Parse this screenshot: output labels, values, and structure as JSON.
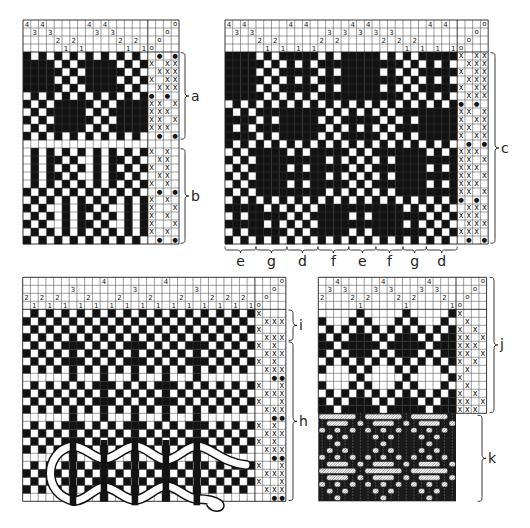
{
  "drafts": [
    {
      "threading": [
        4,
        3,
        4,
        3,
        2,
        1,
        2,
        1,
        4,
        3,
        4,
        3,
        2,
        1,
        2,
        1
      ],
      "tieup_marker": "o",
      "liftplan": [
        {
          "lift": [
            2,
            4
          ],
          "mark": "●"
        },
        {
          "lift": [
            1,
            3,
            4
          ],
          "mark": "x"
        },
        {
          "lift": [
            2,
            3,
            4
          ],
          "mark": "x"
        },
        {
          "lift": [
            1,
            3,
            4
          ],
          "mark": "x"
        },
        {
          "lift": [
            2,
            3,
            4
          ],
          "mark": "x"
        },
        {
          "lift": [
            1,
            3
          ],
          "mark": "●"
        },
        {
          "lift": [
            1,
            2,
            4
          ],
          "mark": "x"
        },
        {
          "lift": [
            1,
            2,
            3
          ],
          "mark": "x"
        },
        {
          "lift": [
            1,
            2,
            4
          ],
          "mark": "x"
        },
        {
          "lift": [
            1,
            2,
            3
          ],
          "mark": "x"
        },
        {
          "lift": [
            2,
            4
          ],
          "mark": "●"
        },
        {
          "lift": [],
          "mark": ""
        },
        {
          "lift": [
            1,
            3
          ],
          "mark": "x"
        },
        {
          "lift": [
            2,
            3
          ],
          "mark": "x"
        },
        {
          "lift": [
            1,
            3
          ],
          "mark": "x"
        },
        {
          "lift": [
            2,
            3
          ],
          "mark": "x"
        },
        {
          "lift": [
            1,
            3
          ],
          "mark": "x"
        },
        {
          "lift": [
            2,
            4
          ],
          "mark": "●"
        },
        {
          "lift": [
            1,
            3
          ],
          "mark": "x"
        },
        {
          "lift": [
            1,
            4
          ],
          "mark": "x"
        },
        {
          "lift": [
            1,
            3
          ],
          "mark": "x"
        },
        {
          "lift": [
            1,
            4
          ],
          "mark": "x"
        },
        {
          "lift": [
            1,
            3
          ],
          "mark": "x"
        },
        {
          "lift": [
            2,
            4
          ],
          "mark": "●"
        }
      ],
      "sections": [
        {
          "label": "a",
          "from_row": 0,
          "to_row": 10
        },
        {
          "label": "b",
          "from_row": 12,
          "to_row": 23
        }
      ]
    },
    {
      "threading": [
        4,
        3,
        4,
        3,
        2,
        1,
        2,
        1,
        4,
        1,
        4,
        1,
        2,
        3,
        2,
        3,
        4,
        3,
        4,
        3,
        2,
        3,
        2,
        1,
        2,
        1,
        4,
        1,
        4,
        1
      ],
      "tieup_marker": "o",
      "liftplan": [
        {
          "lift": [
            1,
            3,
            4
          ],
          "mark": "x"
        },
        {
          "lift": [
            2,
            3,
            4
          ],
          "mark": "x"
        },
        {
          "lift": [
            1,
            3,
            4
          ],
          "mark": "x"
        },
        {
          "lift": [
            2,
            3,
            4
          ],
          "mark": "x"
        },
        {
          "lift": [
            1,
            3,
            4
          ],
          "mark": "x"
        },
        {
          "lift": [
            2,
            3,
            4
          ],
          "mark": "x"
        },
        {
          "lift": [
            1,
            3
          ],
          "mark": "●"
        },
        {
          "lift": [
            1,
            2,
            4
          ],
          "mark": "x"
        },
        {
          "lift": [
            1,
            3,
            4
          ],
          "mark": "x"
        },
        {
          "lift": [
            1,
            2,
            4
          ],
          "mark": "x"
        },
        {
          "lift": [
            1,
            3,
            4
          ],
          "mark": "x"
        },
        {
          "lift": [
            2,
            4
          ],
          "mark": "●"
        },
        {
          "lift": [
            1,
            2,
            3
          ],
          "mark": "x"
        },
        {
          "lift": [
            1,
            2,
            4
          ],
          "mark": "x"
        },
        {
          "lift": [
            1,
            2,
            3
          ],
          "mark": "x"
        },
        {
          "lift": [
            1,
            2,
            4
          ],
          "mark": "x"
        },
        {
          "lift": [
            1,
            2,
            3
          ],
          "mark": "x"
        },
        {
          "lift": [
            1,
            2,
            4
          ],
          "mark": "x"
        },
        {
          "lift": [
            1,
            3
          ],
          "mark": "●"
        },
        {
          "lift": [
            2,
            3,
            4
          ],
          "mark": "x"
        },
        {
          "lift": [
            1,
            2,
            3
          ],
          "mark": "x"
        },
        {
          "lift": [
            2,
            3,
            4
          ],
          "mark": "x"
        },
        {
          "lift": [
            1,
            2,
            3
          ],
          "mark": "x"
        },
        {
          "lift": [
            2,
            4
          ],
          "mark": "●"
        }
      ],
      "sections": [
        {
          "label": "c",
          "from_row": 0,
          "to_row": 23
        }
      ],
      "blocks": [
        {
          "label": "e",
          "from_col": 0,
          "to_col": 3
        },
        {
          "label": "g",
          "from_col": 4,
          "to_col": 7
        },
        {
          "label": "d",
          "from_col": 8,
          "to_col": 11
        },
        {
          "label": "f",
          "from_col": 12,
          "to_col": 15
        },
        {
          "label": "e",
          "from_col": 16,
          "to_col": 19
        },
        {
          "label": "f",
          "from_col": 19,
          "to_col": 22
        },
        {
          "label": "g",
          "from_col": 23,
          "to_col": 25
        },
        {
          "label": "d",
          "from_col": 26,
          "to_col": 29
        }
      ]
    },
    {
      "threading": [
        2,
        1,
        2,
        1,
        2,
        1,
        3,
        1,
        2,
        1,
        4,
        1,
        2,
        1,
        3,
        1,
        2,
        1,
        4,
        1,
        2,
        1,
        3,
        1,
        2,
        1,
        2,
        1,
        2,
        1
      ],
      "tieup_marker": "o",
      "liftplan": [
        {
          "lift": [
            1
          ],
          "mark": "x"
        },
        {
          "lift": [
            2,
            3,
            4
          ],
          "mark": "x"
        },
        {
          "lift": [
            1
          ],
          "mark": "x"
        },
        {
          "lift": [
            2,
            3,
            4
          ],
          "mark": "x"
        },
        {
          "lift": [
            1,
            3
          ],
          "mark": "x"
        },
        {
          "lift": [
            2,
            3,
            4
          ],
          "mark": "x"
        },
        {
          "lift": [
            1,
            3
          ],
          "mark": "x"
        },
        {
          "lift": [
            2,
            3,
            4
          ],
          "mark": "x"
        },
        {
          "lift": [
            3,
            4
          ],
          "mark": "●"
        },
        {
          "lift": [
            1,
            4
          ],
          "mark": "x"
        },
        {
          "lift": [
            2,
            3,
            4
          ],
          "mark": "x"
        },
        {
          "lift": [
            1,
            4
          ],
          "mark": "x"
        },
        {
          "lift": [
            2,
            3,
            4
          ],
          "mark": "x"
        },
        {
          "lift": [
            3,
            4
          ],
          "mark": "●"
        },
        {
          "lift": [
            1,
            3
          ],
          "mark": "x"
        },
        {
          "lift": [
            2,
            3,
            4
          ],
          "mark": "x"
        },
        {
          "lift": [
            1,
            3
          ],
          "mark": "x"
        },
        {
          "lift": [
            2,
            3,
            4
          ],
          "mark": "x"
        },
        {
          "lift": [
            3,
            4
          ],
          "mark": "●"
        },
        {
          "lift": [
            1,
            4
          ],
          "mark": "x"
        },
        {
          "lift": [
            2,
            3,
            4
          ],
          "mark": "x"
        },
        {
          "lift": [
            1,
            4
          ],
          "mark": "x"
        },
        {
          "lift": [
            2,
            3,
            4
          ],
          "mark": "x"
        },
        {
          "lift": [
            3,
            4
          ],
          "mark": "●"
        }
      ],
      "sections": [
        {
          "label": "i",
          "from_row": 0,
          "to_row": 3
        },
        {
          "label": "h",
          "from_row": 4,
          "to_row": 23
        }
      ]
    },
    {
      "threading": [
        2,
        3,
        4,
        3,
        2,
        1,
        2,
        3,
        4,
        3,
        2,
        1,
        2,
        3,
        4,
        3,
        2,
        1
      ],
      "tieup_marker": "o",
      "liftplan": [
        {
          "lift": [
            1
          ],
          "mark": "x"
        },
        {
          "lift": [
            2
          ],
          "mark": "x"
        },
        {
          "lift": [
            1,
            3
          ],
          "mark": "x"
        },
        {
          "lift": [
            1,
            2,
            4
          ],
          "mark": "x"
        },
        {
          "lift": [
            1,
            2,
            3
          ],
          "mark": "x"
        },
        {
          "lift": [
            1,
            2,
            4
          ],
          "mark": "x"
        },
        {
          "lift": [
            1,
            3
          ],
          "mark": "x"
        },
        {
          "lift": [
            2
          ],
          "mark": "x"
        },
        {
          "lift": [
            1
          ],
          "mark": "x"
        },
        {
          "lift": [
            2
          ],
          "mark": "x"
        },
        {
          "lift": [
            1,
            3
          ],
          "mark": "x"
        },
        {
          "lift": [
            1,
            2,
            4
          ],
          "mark": "x"
        },
        {
          "lift": [
            1,
            2,
            3
          ],
          "mark": "x"
        }
      ],
      "sections": [
        {
          "label": "j",
          "from_row": 0,
          "to_row": 12
        }
      ],
      "cloth_view": {
        "label": "k"
      }
    }
  ]
}
